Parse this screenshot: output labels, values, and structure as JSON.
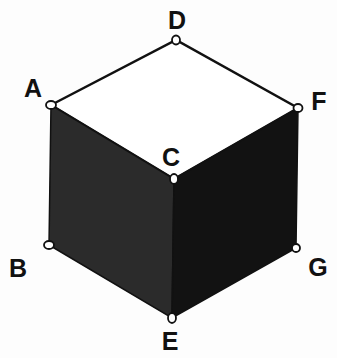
{
  "diagram": {
    "type": "isometric-cube",
    "vertices": {
      "A": {
        "label": "A"
      },
      "B": {
        "label": "B"
      },
      "C": {
        "label": "C"
      },
      "D": {
        "label": "D"
      },
      "E": {
        "label": "E"
      },
      "F": {
        "label": "F"
      },
      "G": {
        "label": "G"
      }
    },
    "edges": [
      [
        "A",
        "D"
      ],
      [
        "D",
        "F"
      ],
      [
        "A",
        "C"
      ],
      [
        "C",
        "F"
      ],
      [
        "A",
        "B"
      ],
      [
        "B",
        "E"
      ],
      [
        "C",
        "E"
      ],
      [
        "F",
        "G"
      ],
      [
        "G",
        "E"
      ]
    ],
    "faces": [
      {
        "name": "top",
        "vertices": [
          "A",
          "D",
          "F",
          "C"
        ],
        "color": "#ffffff"
      },
      {
        "name": "left",
        "vertices": [
          "A",
          "C",
          "E",
          "B"
        ],
        "color": "#2b2b2b"
      },
      {
        "name": "right",
        "vertices": [
          "C",
          "F",
          "G",
          "E"
        ],
        "color": "#121212"
      }
    ],
    "colors": {
      "edge": "#111111",
      "vertex_fill": "#ffffff"
    }
  }
}
